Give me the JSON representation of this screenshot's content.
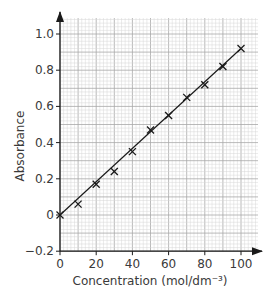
{
  "chart_data": {
    "type": "scatter",
    "title": "",
    "xlabel": "Concentration (mol/dm⁻³)",
    "ylabel": "Absorbance",
    "xlim": [
      0,
      100
    ],
    "ylim": [
      -0.2,
      1.0
    ],
    "grid": true,
    "x_ticks": [
      0,
      20,
      40,
      60,
      80,
      100
    ],
    "y_ticks": [
      -0.2,
      0,
      0.2,
      0.4,
      0.6,
      0.8,
      1.0
    ],
    "x_tick_labels": [
      "0",
      "20",
      "40",
      "60",
      "80",
      "100"
    ],
    "y_tick_labels": [
      "−0.2",
      "0",
      "0.2",
      "0.4",
      "0.6",
      "0.8",
      "1.0"
    ],
    "series": [
      {
        "name": "measurements",
        "marker": "x",
        "x": [
          0,
          10,
          20,
          30,
          40,
          50,
          60,
          70,
          80,
          90,
          100
        ],
        "y": [
          0.0,
          0.06,
          0.17,
          0.24,
          0.35,
          0.47,
          0.55,
          0.65,
          0.72,
          0.82,
          0.92
        ]
      },
      {
        "name": "line of best fit",
        "type": "line",
        "x": [
          0,
          100
        ],
        "y": [
          0.0,
          0.92
        ]
      }
    ],
    "legend": null
  },
  "colors": {
    "grid_minor": "#d6d6d6",
    "grid_major": "#a8a8a8",
    "axis": "#1a1a1a",
    "marker": "#1a1a1a",
    "text": "#3a3a3a"
  }
}
